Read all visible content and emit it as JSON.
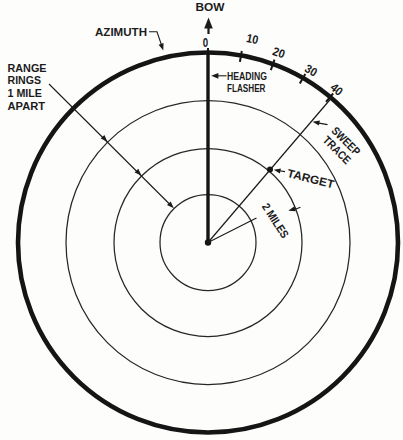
{
  "figure": {
    "colors": {
      "ink": "#1b1b1b",
      "background": "#fdfdfc"
    },
    "bow": {
      "label": "BOW"
    },
    "azimuth": {
      "label": "AZIMUTH"
    },
    "azimuth_scale": {
      "tick_labels": [
        "0",
        "10",
        "20",
        "30",
        "40"
      ]
    },
    "range_rings": {
      "note_lines": [
        "RANGE",
        "RINGS",
        "1 MILE",
        "APART"
      ]
    },
    "heading_flasher": {
      "label_lines": [
        "HEADING",
        "FLASHER"
      ]
    },
    "sweep_trace": {
      "label_lines": [
        "SWEEP",
        "TRACE"
      ]
    },
    "target": {
      "label": "TARGET"
    },
    "range_dimension": {
      "label": "2 MILES"
    }
  }
}
